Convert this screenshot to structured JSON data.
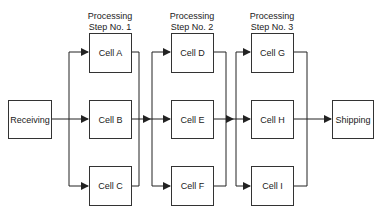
{
  "diagram": {
    "type": "process-flow",
    "start": {
      "label": "Receiving"
    },
    "end": {
      "label": "Shipping"
    },
    "steps": [
      {
        "title_line1": "Processing",
        "title_line2": "Step No. 1",
        "cells": [
          "Cell A",
          "Cell B",
          "Cell C"
        ]
      },
      {
        "title_line1": "Processing",
        "title_line2": "Step No. 2",
        "cells": [
          "Cell D",
          "Cell E",
          "Cell F"
        ]
      },
      {
        "title_line1": "Processing",
        "title_line2": "Step No. 3",
        "cells": [
          "Cell G",
          "Cell H",
          "Cell I"
        ]
      }
    ],
    "line_color": "#222222"
  }
}
